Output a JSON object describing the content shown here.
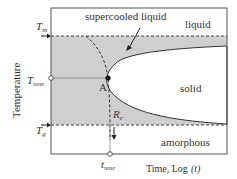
{
  "diagram": {
    "type": "TTT diagram",
    "axes": {
      "ylabel": "Temperature",
      "xlabel": "Time, Log",
      "xlabel_var": "(t)"
    },
    "y_ticks": [
      {
        "symbol": "T",
        "sub": "m"
      },
      {
        "symbol": "T",
        "sub": "nose"
      },
      {
        "symbol": "T",
        "sub": "g"
      }
    ],
    "x_ticks": [
      {
        "symbol": "t",
        "sub": "nose"
      }
    ],
    "regions": {
      "supercooled_liquid": "supercooled liquid",
      "liquid": "liquid",
      "solid": "solid",
      "amorphous": "amorphous"
    },
    "points": {
      "nose_point": "A",
      "critical_rate": {
        "symbol": "R",
        "sub": "c"
      }
    },
    "colors": {
      "shaded": "#cfcfcf",
      "line": "#333333",
      "frame": "#555555"
    }
  }
}
